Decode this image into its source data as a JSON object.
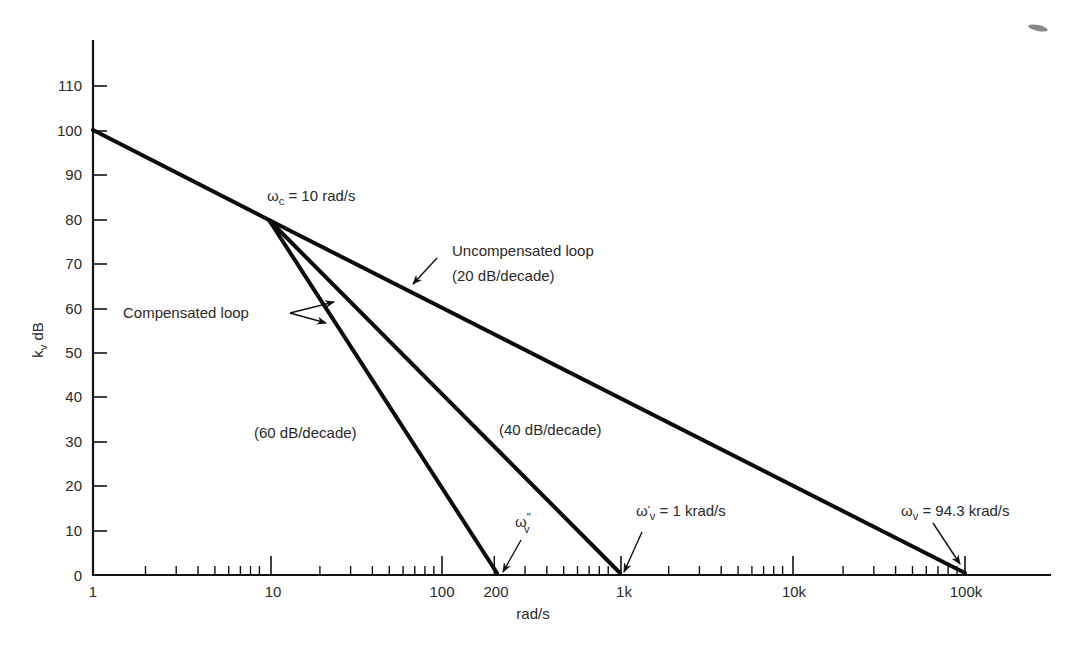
{
  "chart_data": {
    "type": "line",
    "title": "",
    "xlabel": "rad/s",
    "ylabel": "k_v dB",
    "xscale": "log",
    "xlim": [
      1,
      300000
    ],
    "ylim": [
      0,
      115
    ],
    "x_tick_labels": [
      "1",
      "10",
      "100",
      "200",
      "1k",
      "10k",
      "100k"
    ],
    "x_tick_values": [
      1,
      10,
      100,
      200,
      1000,
      10000,
      100000
    ],
    "y_tick_labels": [
      "0",
      "10",
      "20",
      "30",
      "40",
      "50",
      "60",
      "70",
      "80",
      "90",
      "100",
      "110"
    ],
    "y_tick_values": [
      0,
      10,
      20,
      30,
      40,
      50,
      60,
      70,
      80,
      90,
      100,
      110
    ],
    "grid": false,
    "series": [
      {
        "name": "Uncompensated loop (20 dB/decade)",
        "x": [
          1,
          10,
          94300
        ],
        "y": [
          100,
          80,
          0
        ]
      },
      {
        "name": "Compensated loop (40 dB/decade)",
        "x": [
          10,
          1000
        ],
        "y": [
          80,
          0
        ]
      },
      {
        "name": "Compensated loop (60 dB/decade)",
        "x": [
          10,
          200
        ],
        "y": [
          80,
          0
        ]
      }
    ],
    "annotations": [
      {
        "text": "ωc = 10 rad/s",
        "x": 10,
        "y": 80
      },
      {
        "text": "Uncompensated loop",
        "x": 200,
        "y": 68
      },
      {
        "text": "(20 dB/decade)",
        "x": 200,
        "y": 62
      },
      {
        "text": "Compensated loop",
        "x": 2,
        "y": 60
      },
      {
        "text": "(60 dB/decade)",
        "x": 20,
        "y": 32
      },
      {
        "text": "(40 dB/decade)",
        "x": 200,
        "y": 33
      },
      {
        "text": "ω''v",
        "x": 200,
        "y": 0
      },
      {
        "text": "ω'v = 1 krad/s",
        "x": 1000,
        "y": 0
      },
      {
        "text": "ωv = 94.3 krad/s",
        "x": 94300,
        "y": 0
      }
    ]
  },
  "labels": {
    "ylabel_main": "k",
    "ylabel_sub": "v",
    "ylabel_unit": " dB",
    "xlabel": "rad/s",
    "wc_main": "ω",
    "wc_sub": "c",
    "wc_rest": " = 10 rad/s",
    "uncomp_line1": "Uncompensated loop",
    "uncomp_line2": "(20 dB/decade)",
    "comp": "Compensated loop",
    "slope60": "(60 dB/decade)",
    "slope40": "(40 dB/decade)",
    "wvpp_main": "ω",
    "wvpp_sup": "''",
    "wvpp_sub": "v",
    "wvp_main": "ω",
    "wvp_sup": "'",
    "wvp_sub": "v",
    "wvp_rest": " = 1 krad/s",
    "wv_main": "ω",
    "wv_sub": "v",
    "wv_rest": " = 94.3 krad/s"
  },
  "yticks": [
    "0",
    "10",
    "20",
    "30",
    "40",
    "50",
    "60",
    "70",
    "80",
    "90",
    "100",
    "110"
  ],
  "xticks": [
    "1",
    "10",
    "100",
    "200",
    "1k",
    "10k",
    "100k"
  ]
}
